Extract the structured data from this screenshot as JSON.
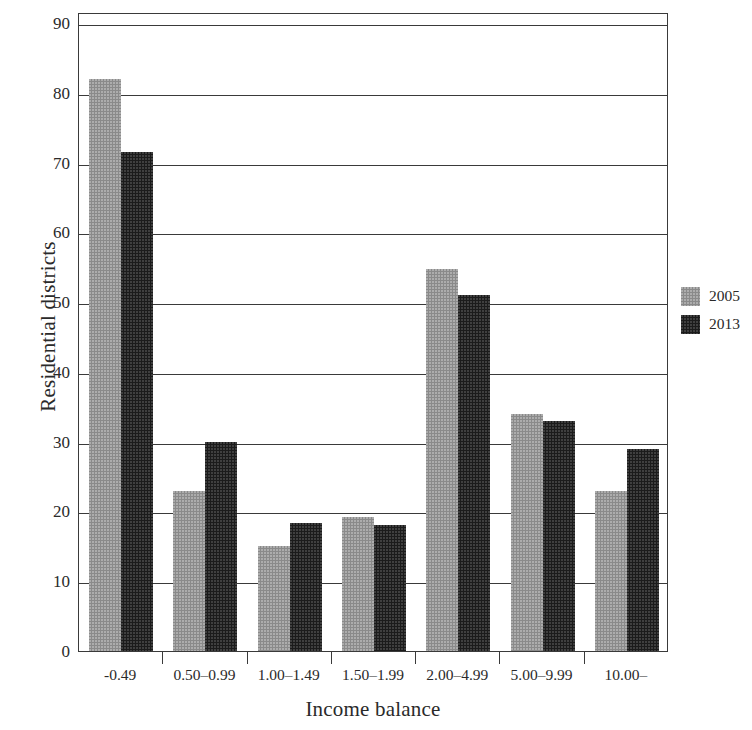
{
  "chart_data": {
    "type": "bar",
    "title": "",
    "xlabel": "Income balance",
    "ylabel": "Residential districts",
    "categories": [
      "-0.49",
      "0.50–0.99",
      "1.00–1.49",
      "1.50–1.99",
      "2.00–4.99",
      "5.00–9.99",
      "10.00–"
    ],
    "series": [
      {
        "name": "2005",
        "color": "#8a8a8a",
        "values": [
          82,
          23,
          15,
          19.2,
          54.7,
          34,
          23
        ]
      },
      {
        "name": "2013",
        "color": "#1b1b1b",
        "values": [
          71.5,
          30,
          18.3,
          18.1,
          51,
          33,
          29
        ]
      }
    ],
    "ylim": [
      0,
      90
    ],
    "yticks": [
      0,
      10,
      20,
      30,
      40,
      50,
      60,
      70,
      80,
      90
    ],
    "ytick_labels": [
      "0",
      "10",
      "20",
      "30",
      "40",
      "50",
      "60",
      "70",
      "80",
      "90"
    ],
    "grid": true,
    "grid_axis": "y",
    "legend_position": "right"
  },
  "legend": {
    "entries": [
      {
        "label": "2005"
      },
      {
        "label": "2013"
      }
    ]
  },
  "axes": {
    "y_title": "Residential districts",
    "x_title": "Income balance"
  }
}
